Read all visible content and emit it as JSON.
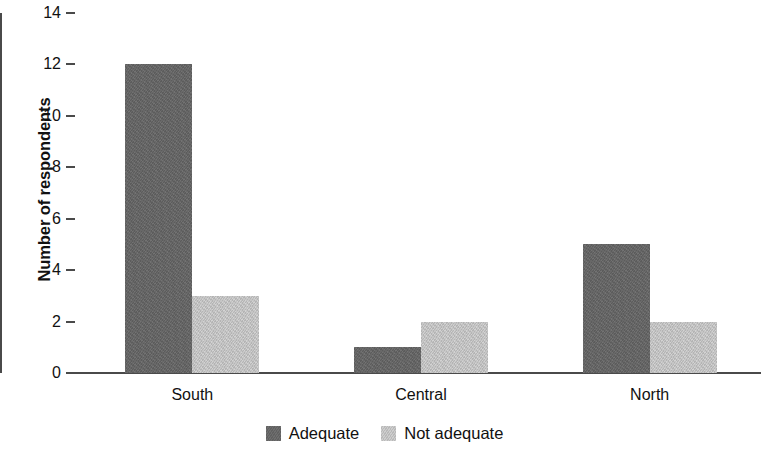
{
  "chart_data": {
    "type": "bar",
    "title": "",
    "subtitle": "",
    "xlabel": "",
    "ylabel": "Number of respondents",
    "categories": [
      "South",
      "Central",
      "North"
    ],
    "series": [
      {
        "name": "Adequate",
        "color": "#656565",
        "values": [
          12,
          1,
          5
        ]
      },
      {
        "name": "Not adequate",
        "color": "#c3c3c3",
        "values": [
          3,
          2,
          2
        ]
      }
    ],
    "ylim": [
      0,
      14
    ],
    "ytick_step": 2,
    "yticks": [
      0,
      2,
      4,
      6,
      8,
      10,
      12,
      14
    ],
    "ytick_labels": [
      "0",
      "2",
      "4",
      "6",
      "8",
      "10",
      "12",
      "14"
    ],
    "grid": false,
    "legend_position": "bottom-center",
    "background_color": "#ffffff",
    "axis_color": "#4a4a4a"
  },
  "legend": {
    "items": [
      {
        "label": "Adequate",
        "swatch": "adequate-swatch"
      },
      {
        "label": "Not adequate",
        "swatch": "not-adequate-swatch"
      }
    ]
  }
}
